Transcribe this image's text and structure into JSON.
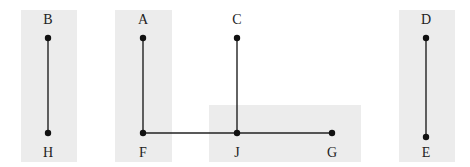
{
  "colors": {
    "region_fill": "#ececec",
    "line": "#222222",
    "node": "#111111",
    "label": "#222222"
  },
  "regions": [
    {
      "id": "region-bh",
      "x": 21,
      "y": 10,
      "w": 56,
      "h": 152
    },
    {
      "id": "region-af",
      "x": 115,
      "y": 10,
      "w": 57,
      "h": 152
    },
    {
      "id": "region-jg",
      "x": 209,
      "y": 105,
      "w": 152,
      "h": 57
    },
    {
      "id": "region-de",
      "x": 399,
      "y": 10,
      "w": 56,
      "h": 152
    }
  ],
  "nodes": [
    {
      "id": "B",
      "label": "B",
      "x": 48,
      "y": 38,
      "label_x": 48,
      "label_y": 24
    },
    {
      "id": "H",
      "label": "H",
      "x": 48,
      "y": 133,
      "label_x": 48,
      "label_y": 157
    },
    {
      "id": "A",
      "label": "A",
      "x": 143,
      "y": 38,
      "label_x": 143,
      "label_y": 24
    },
    {
      "id": "F",
      "label": "F",
      "x": 143,
      "y": 133,
      "label_x": 143,
      "label_y": 157
    },
    {
      "id": "C",
      "label": "C",
      "x": 237,
      "y": 38,
      "label_x": 237,
      "label_y": 24
    },
    {
      "id": "J",
      "label": "J",
      "x": 237,
      "y": 133,
      "label_x": 237,
      "label_y": 157
    },
    {
      "id": "G",
      "label": "G",
      "x": 332,
      "y": 133,
      "label_x": 332,
      "label_y": 157
    },
    {
      "id": "D",
      "label": "D",
      "x": 426,
      "y": 38,
      "label_x": 426,
      "label_y": 24
    },
    {
      "id": "E",
      "label": "E",
      "x": 426,
      "y": 137,
      "label_x": 426,
      "label_y": 157
    }
  ],
  "edges": [
    {
      "from": "B",
      "to": "H"
    },
    {
      "from": "A",
      "to": "F"
    },
    {
      "from": "F",
      "to": "J"
    },
    {
      "from": "C",
      "to": "J"
    },
    {
      "from": "J",
      "to": "G"
    },
    {
      "from": "D",
      "to": "E"
    }
  ]
}
